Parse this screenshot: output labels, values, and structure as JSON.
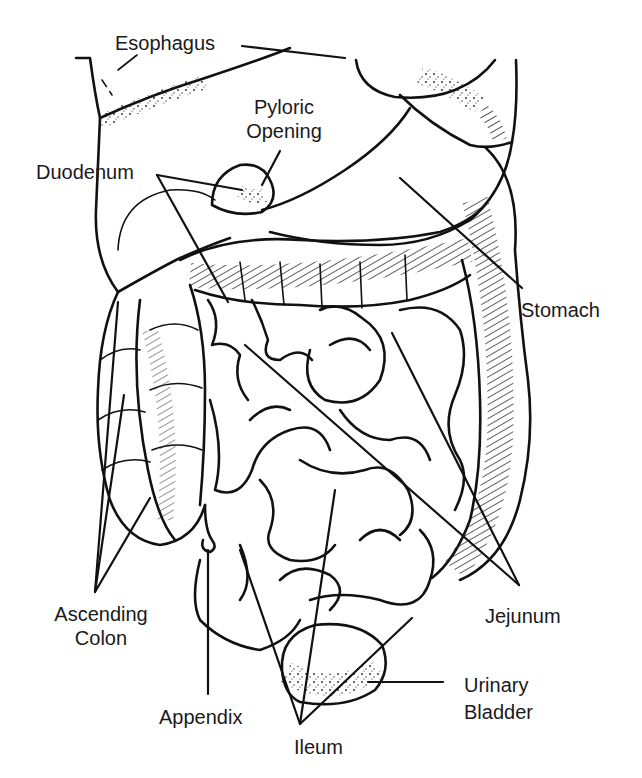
{
  "diagram": {
    "type": "anatomical-illustration",
    "background_color": "#ffffff",
    "ink_color": "#111111",
    "labels": [
      {
        "id": "esophagus",
        "text": "Esophagus"
      },
      {
        "id": "pyloric_opening",
        "lines": [
          "Pyloric",
          "Opening"
        ]
      },
      {
        "id": "duodenum",
        "text": "Duodenum"
      },
      {
        "id": "stomach",
        "text": "Stomach"
      },
      {
        "id": "ascending_colon",
        "lines": [
          "Ascending",
          "Colon"
        ]
      },
      {
        "id": "jejunum",
        "text": "Jejunum"
      },
      {
        "id": "urinary_bladder",
        "lines": [
          "Urinary",
          "Bladder"
        ]
      },
      {
        "id": "appendix",
        "text": "Appendix"
      },
      {
        "id": "ileum",
        "text": "Ileum"
      }
    ]
  }
}
